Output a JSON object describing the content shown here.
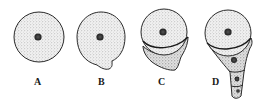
{
  "figure": {
    "panels": [
      {
        "id": "A",
        "label": "A",
        "stage": "single round cell with central nucleus"
      },
      {
        "id": "B",
        "label": "B",
        "stage": "cell forming small basal protrusion"
      },
      {
        "id": "C",
        "label": "C",
        "stage": "cell with lower segment cut off by curved wall"
      },
      {
        "id": "D",
        "label": "D",
        "stage": "cell with tapering chain of three nucleated segments"
      }
    ],
    "colors": {
      "outline": "#2a2a2a",
      "fill": "#e9e9e9",
      "stipple": "#8a8a8a",
      "nucleus": "#3a3a3a",
      "background": "#ffffff"
    }
  }
}
